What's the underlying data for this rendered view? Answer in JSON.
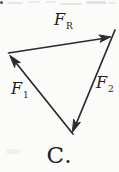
{
  "diagram": {
    "type": "force-vector-triangle",
    "background_color": "#fbfbfa",
    "stroke_color": "#2a2a2a",
    "text_color": "#1c1c1c",
    "labels": {
      "fr": {
        "main": "F",
        "sub": "R"
      },
      "f1": {
        "main": "F",
        "sub": "1"
      },
      "f2": {
        "main": "F",
        "sub": "2"
      }
    },
    "vectors": [
      {
        "name": "F_R",
        "from": "left-vertex",
        "to": "right-vertex",
        "arrowhead_at": "right-vertex"
      },
      {
        "name": "F_1",
        "from": "bottom-vertex",
        "to": "left-vertex",
        "arrowhead_at": "left-vertex"
      },
      {
        "name": "F_2",
        "from": "right-vertex",
        "to": "bottom-vertex",
        "arrowhead_at": "bottom-vertex"
      }
    ],
    "caption": "C."
  }
}
